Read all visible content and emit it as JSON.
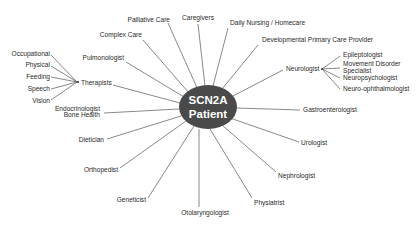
{
  "diagram": {
    "center": {
      "line1": "SCN2A",
      "line2": "Patient",
      "fill": "#4a4a4a"
    },
    "nodes": {
      "palliative_care": "Palliative Care",
      "caregivers": "Caregivers",
      "daily_nursing": "Daily Nursing / Homecare",
      "developmental_pcp": "Developmental Primary Care Provider",
      "complex_care": "Complex Care",
      "pulmonologist": "Pulmonologist",
      "therapists": "Therapists",
      "endocrinologist": "Endocrinologist",
      "bone_health": "Bone Health",
      "dietician": "Dietician",
      "orthopedist": "Orthopedist",
      "geneticist": "Geneticist",
      "otolaryngologist": "Otolaryngologist",
      "physiatrist": "Physiatrist",
      "nephrologist": "Nephrologist",
      "urologist": "Urologist",
      "gastroenterologist": "Gastroenterologist",
      "neurologist": "Neurologist"
    },
    "therapist_types": [
      "Occupational",
      "Physical",
      "Feeding",
      "Speech",
      "Vision"
    ],
    "neurology_subspecialties": {
      "epileptologist": "Epileptologist",
      "movement_disorder_1": "Movement Disorder",
      "movement_disorder_2": "Specialist",
      "neuropsychologist": "Neuropsychologist",
      "neuro_ophthalmologist": "Neuro-ophthalmologist"
    }
  }
}
